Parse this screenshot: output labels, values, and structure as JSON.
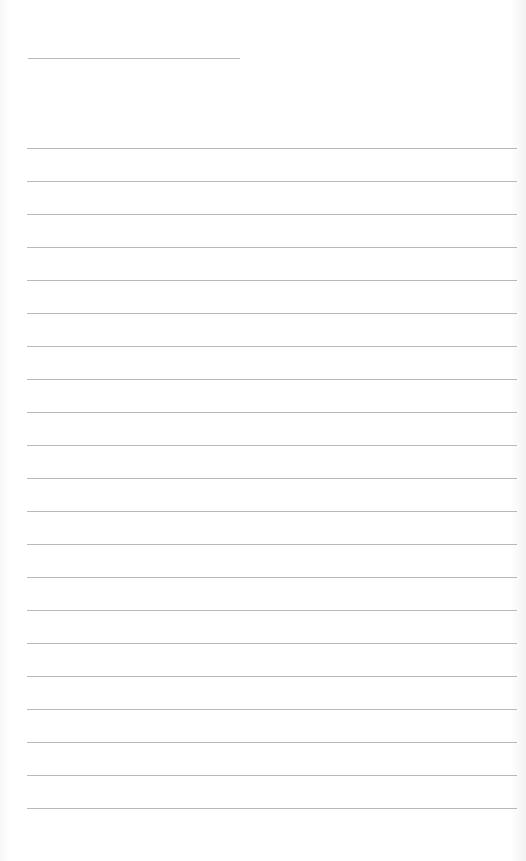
{
  "page": {
    "type": "lined-paper",
    "background_color": "#ffffff",
    "rule_color": "#b9b9b9",
    "header_line": {
      "top": 58,
      "left": 28,
      "width": 212
    },
    "ruled_lines": {
      "count": 21,
      "first_top": 148,
      "spacing": 33,
      "left": 27,
      "width": 490
    }
  }
}
